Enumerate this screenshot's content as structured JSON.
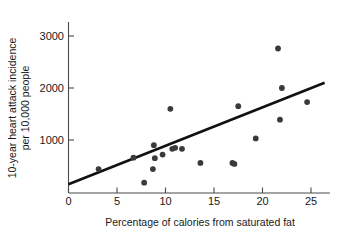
{
  "chart_data": {
    "type": "scatter",
    "title": "",
    "xlabel": "Percentage of calories from saturated fat",
    "ylabel": "10-year heart attack incidence per 10,000 people",
    "ylabel_line1": "10-year heart attack incidence",
    "ylabel_line2": "per 10,000 people",
    "xlim": [
      0,
      26.5
    ],
    "ylim": [
      0,
      3250
    ],
    "grid": false,
    "legend": false,
    "xticks": [
      0,
      5,
      10,
      15,
      20,
      25
    ],
    "xtick_labels": [
      "0",
      "5",
      "10",
      "15",
      "20",
      "25"
    ],
    "yticks": [
      1000,
      2000,
      3000
    ],
    "ytick_labels": [
      "1000",
      "2000",
      "3000"
    ],
    "point_color": "#3a3a3a",
    "line_color": "#111111",
    "axis_color": "#4a4a4a",
    "points": [
      {
        "x": 3.1,
        "y": 440
      },
      {
        "x": 6.7,
        "y": 660
      },
      {
        "x": 7.8,
        "y": 180
      },
      {
        "x": 8.7,
        "y": 440
      },
      {
        "x": 8.8,
        "y": 900
      },
      {
        "x": 8.9,
        "y": 650
      },
      {
        "x": 9.7,
        "y": 720
      },
      {
        "x": 10.5,
        "y": 1600
      },
      {
        "x": 10.7,
        "y": 830
      },
      {
        "x": 11.0,
        "y": 850
      },
      {
        "x": 11.7,
        "y": 830
      },
      {
        "x": 13.6,
        "y": 560
      },
      {
        "x": 16.9,
        "y": 560
      },
      {
        "x": 17.1,
        "y": 540
      },
      {
        "x": 17.5,
        "y": 1650
      },
      {
        "x": 19.3,
        "y": 1030
      },
      {
        "x": 21.6,
        "y": 2760
      },
      {
        "x": 21.8,
        "y": 1390
      },
      {
        "x": 22.0,
        "y": 2000
      },
      {
        "x": 24.6,
        "y": 1730
      }
    ],
    "trend_line": {
      "x0": 0.0,
      "y0": 150,
      "x1": 26.4,
      "y1": 2100
    }
  }
}
